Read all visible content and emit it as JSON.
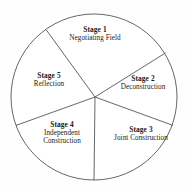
{
  "diagram": {
    "shape": "circle-divided-into-five-sectors",
    "stroke_color": "#555555",
    "fill_color": "#ffffff",
    "text_color": "#1a1a1a",
    "geometry": {
      "center_x": 94,
      "center_y": 97,
      "radius": 83,
      "divider_angles_deg": [
        -126,
        -32,
        20,
        90,
        200
      ]
    },
    "sectors": [
      {
        "id": "stage-1",
        "stage": "Stage 1",
        "name": "Negotiating Field",
        "name_lines": [
          "Negotiating Field"
        ]
      },
      {
        "id": "stage-2",
        "stage": "Stage 2",
        "name": "Deconstruction",
        "name_lines": [
          "Deconstruction"
        ]
      },
      {
        "id": "stage-3",
        "stage": "Stage 3",
        "name": "Joint Construction",
        "name_lines": [
          "Joint Construction"
        ]
      },
      {
        "id": "stage-4",
        "stage": "Stage 4",
        "name": "Independent Construction",
        "name_lines": [
          "Independent",
          "Construction"
        ]
      },
      {
        "id": "stage-5",
        "stage": "Stage 5",
        "name": "Reflection",
        "name_lines": [
          "Reflection"
        ]
      }
    ]
  }
}
